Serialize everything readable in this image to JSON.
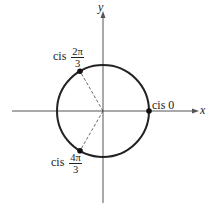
{
  "diagram": {
    "title": "",
    "axes": {
      "x_label": "x",
      "y_label": "y"
    },
    "circle": {
      "type": "unit circle",
      "center": "origin"
    },
    "points": [
      {
        "label_prefix": "cis",
        "numerator": "2π",
        "denominator": "3",
        "angle": "2π/3"
      },
      {
        "label_prefix": "cis",
        "value": "0",
        "angle": "0"
      },
      {
        "label_prefix": "cis",
        "numerator": "4π",
        "denominator": "3",
        "angle": "4π/3"
      }
    ],
    "colors": {
      "stroke": "#222222",
      "dashed": "#444444",
      "background": "#ffffff"
    }
  }
}
